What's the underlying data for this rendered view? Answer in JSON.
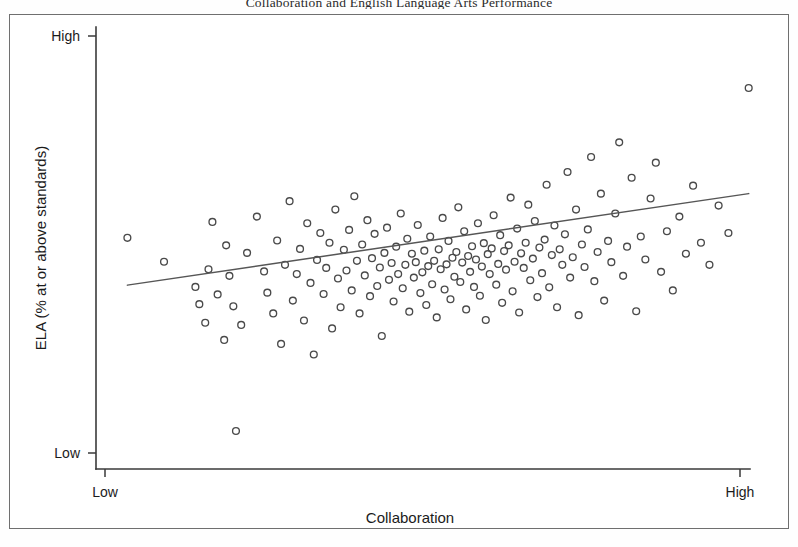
{
  "figure": {
    "title": "Collaboration and English Language Arts Performance",
    "frame_color": "#6f6f6f",
    "background": "#ffffff"
  },
  "chart_data": {
    "type": "scatter",
    "title": "Collaboration and English Language Arts Performance",
    "xlabel": "Collaboration",
    "ylabel": "ELA (% at or above standards)",
    "xtick_labels": [
      "Low",
      "High"
    ],
    "ytick_labels": [
      "Low",
      "High"
    ],
    "xlim": [
      0,
      1
    ],
    "ylim": [
      0,
      1
    ],
    "grid": false,
    "legend": null,
    "marker": "open-circle",
    "marker_color": "#4a4a4a",
    "n_points": 176,
    "trendline": {
      "type": "linear-fit",
      "color": "#565656",
      "x_start": 0.048,
      "y_start": 0.416,
      "x_end": 0.998,
      "y_end": 0.623
    },
    "points": [
      [
        0.048,
        0.523
      ],
      [
        0.104,
        0.469
      ],
      [
        0.152,
        0.412
      ],
      [
        0.158,
        0.373
      ],
      [
        0.167,
        0.331
      ],
      [
        0.172,
        0.452
      ],
      [
        0.178,
        0.559
      ],
      [
        0.186,
        0.395
      ],
      [
        0.196,
        0.292
      ],
      [
        0.199,
        0.506
      ],
      [
        0.204,
        0.437
      ],
      [
        0.21,
        0.368
      ],
      [
        0.214,
        0.086
      ],
      [
        0.222,
        0.326
      ],
      [
        0.231,
        0.489
      ],
      [
        0.246,
        0.571
      ],
      [
        0.257,
        0.447
      ],
      [
        0.262,
        0.399
      ],
      [
        0.271,
        0.352
      ],
      [
        0.277,
        0.517
      ],
      [
        0.283,
        0.283
      ],
      [
        0.289,
        0.462
      ],
      [
        0.296,
        0.606
      ],
      [
        0.301,
        0.381
      ],
      [
        0.307,
        0.441
      ],
      [
        0.312,
        0.498
      ],
      [
        0.318,
        0.336
      ],
      [
        0.323,
        0.556
      ],
      [
        0.328,
        0.421
      ],
      [
        0.333,
        0.259
      ],
      [
        0.338,
        0.473
      ],
      [
        0.343,
        0.534
      ],
      [
        0.348,
        0.396
      ],
      [
        0.352,
        0.455
      ],
      [
        0.357,
        0.512
      ],
      [
        0.361,
        0.318
      ],
      [
        0.366,
        0.587
      ],
      [
        0.37,
        0.431
      ],
      [
        0.374,
        0.366
      ],
      [
        0.379,
        0.496
      ],
      [
        0.383,
        0.449
      ],
      [
        0.387,
        0.541
      ],
      [
        0.391,
        0.404
      ],
      [
        0.395,
        0.617
      ],
      [
        0.399,
        0.471
      ],
      [
        0.403,
        0.352
      ],
      [
        0.407,
        0.508
      ],
      [
        0.411,
        0.438
      ],
      [
        0.415,
        0.563
      ],
      [
        0.419,
        0.391
      ],
      [
        0.422,
        0.477
      ],
      [
        0.426,
        0.532
      ],
      [
        0.43,
        0.414
      ],
      [
        0.434,
        0.456
      ],
      [
        0.437,
        0.301
      ],
      [
        0.441,
        0.489
      ],
      [
        0.445,
        0.546
      ],
      [
        0.448,
        0.428
      ],
      [
        0.452,
        0.466
      ],
      [
        0.455,
        0.379
      ],
      [
        0.459,
        0.503
      ],
      [
        0.462,
        0.441
      ],
      [
        0.466,
        0.578
      ],
      [
        0.469,
        0.409
      ],
      [
        0.473,
        0.462
      ],
      [
        0.476,
        0.521
      ],
      [
        0.479,
        0.356
      ],
      [
        0.483,
        0.487
      ],
      [
        0.486,
        0.433
      ],
      [
        0.489,
        0.468
      ],
      [
        0.492,
        0.552
      ],
      [
        0.496,
        0.398
      ],
      [
        0.499,
        0.445
      ],
      [
        0.502,
        0.494
      ],
      [
        0.505,
        0.371
      ],
      [
        0.508,
        0.459
      ],
      [
        0.511,
        0.526
      ],
      [
        0.514,
        0.418
      ],
      [
        0.517,
        0.471
      ],
      [
        0.521,
        0.343
      ],
      [
        0.524,
        0.497
      ],
      [
        0.527,
        0.452
      ],
      [
        0.53,
        0.568
      ],
      [
        0.533,
        0.406
      ],
      [
        0.536,
        0.463
      ],
      [
        0.539,
        0.516
      ],
      [
        0.542,
        0.384
      ],
      [
        0.545,
        0.478
      ],
      [
        0.548,
        0.435
      ],
      [
        0.551,
        0.491
      ],
      [
        0.554,
        0.592
      ],
      [
        0.557,
        0.423
      ],
      [
        0.56,
        0.467
      ],
      [
        0.563,
        0.538
      ],
      [
        0.566,
        0.361
      ],
      [
        0.569,
        0.482
      ],
      [
        0.572,
        0.446
      ],
      [
        0.575,
        0.504
      ],
      [
        0.578,
        0.412
      ],
      [
        0.581,
        0.474
      ],
      [
        0.584,
        0.556
      ],
      [
        0.587,
        0.392
      ],
      [
        0.59,
        0.458
      ],
      [
        0.593,
        0.511
      ],
      [
        0.596,
        0.337
      ],
      [
        0.599,
        0.486
      ],
      [
        0.602,
        0.441
      ],
      [
        0.605,
        0.499
      ],
      [
        0.608,
        0.574
      ],
      [
        0.612,
        0.417
      ],
      [
        0.615,
        0.464
      ],
      [
        0.618,
        0.529
      ],
      [
        0.621,
        0.376
      ],
      [
        0.624,
        0.493
      ],
      [
        0.627,
        0.451
      ],
      [
        0.631,
        0.506
      ],
      [
        0.634,
        0.614
      ],
      [
        0.637,
        0.402
      ],
      [
        0.64,
        0.469
      ],
      [
        0.644,
        0.544
      ],
      [
        0.647,
        0.354
      ],
      [
        0.65,
        0.488
      ],
      [
        0.654,
        0.455
      ],
      [
        0.657,
        0.512
      ],
      [
        0.661,
        0.598
      ],
      [
        0.664,
        0.427
      ],
      [
        0.668,
        0.476
      ],
      [
        0.671,
        0.561
      ],
      [
        0.675,
        0.389
      ],
      [
        0.678,
        0.501
      ],
      [
        0.682,
        0.443
      ],
      [
        0.686,
        0.519
      ],
      [
        0.689,
        0.643
      ],
      [
        0.693,
        0.411
      ],
      [
        0.697,
        0.484
      ],
      [
        0.701,
        0.551
      ],
      [
        0.705,
        0.366
      ],
      [
        0.709,
        0.497
      ],
      [
        0.713,
        0.462
      ],
      [
        0.717,
        0.531
      ],
      [
        0.721,
        0.672
      ],
      [
        0.725,
        0.433
      ],
      [
        0.729,
        0.479
      ],
      [
        0.734,
        0.587
      ],
      [
        0.738,
        0.348
      ],
      [
        0.743,
        0.508
      ],
      [
        0.747,
        0.457
      ],
      [
        0.752,
        0.542
      ],
      [
        0.757,
        0.706
      ],
      [
        0.762,
        0.425
      ],
      [
        0.767,
        0.491
      ],
      [
        0.772,
        0.623
      ],
      [
        0.777,
        0.381
      ],
      [
        0.783,
        0.516
      ],
      [
        0.788,
        0.468
      ],
      [
        0.794,
        0.578
      ],
      [
        0.8,
        0.739
      ],
      [
        0.806,
        0.437
      ],
      [
        0.812,
        0.503
      ],
      [
        0.819,
        0.659
      ],
      [
        0.826,
        0.357
      ],
      [
        0.833,
        0.526
      ],
      [
        0.84,
        0.474
      ],
      [
        0.848,
        0.612
      ],
      [
        0.856,
        0.693
      ],
      [
        0.864,
        0.446
      ],
      [
        0.873,
        0.538
      ],
      [
        0.882,
        0.404
      ],
      [
        0.892,
        0.571
      ],
      [
        0.902,
        0.487
      ],
      [
        0.913,
        0.641
      ],
      [
        0.925,
        0.512
      ],
      [
        0.938,
        0.462
      ],
      [
        0.952,
        0.596
      ],
      [
        0.967,
        0.534
      ],
      [
        0.998,
        0.862
      ]
    ]
  }
}
